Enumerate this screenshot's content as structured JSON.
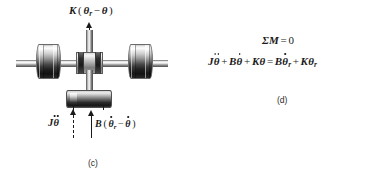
{
  "figure": {
    "panel_c": {
      "caption": "(c)",
      "spring_torque_label": {
        "symbol": "K",
        "expression": "K(θr − θ)",
        "parts": {
          "k": "K",
          "open": "(",
          "theta_r": "θ",
          "sub_r": "r",
          "minus": "−",
          "theta": "θ",
          "close": ")"
        }
      },
      "inertia_torque_label": {
        "expression": "Jθ̈",
        "parts": {
          "j": "J",
          "theta": "θ"
        }
      },
      "damper_torque_label": {
        "expression": "B(θ̇r − θ̇)",
        "parts": {
          "b": "B",
          "open": "(",
          "theta_r": "θ",
          "sub_r": "r",
          "minus": "−",
          "theta": "θ",
          "close": ")"
        }
      },
      "components": {
        "left_flywheel": "left-flywheel",
        "right_flywheel": "right-flywheel",
        "center_hub": "center-hub",
        "horizontal_shaft": "horizontal-shaft",
        "vertical_shaft": "vertical-shaft",
        "damper_disk": "damper-disk"
      }
    },
    "panel_d": {
      "caption": "(d)",
      "equation_1": {
        "expression": "ΣM = 0",
        "parts": {
          "sigma": "Σ",
          "m": "M",
          "equals": "=",
          "zero": "0"
        }
      },
      "equation_2": {
        "expression": "Jθ̈ + Bθ̇ + Kθ = Bθ̇r + Kθr",
        "parts": {
          "j": "J",
          "theta_ddot": "θ",
          "plus1": "+",
          "b": "B",
          "theta_dot": "θ",
          "plus2": "+",
          "k": "K",
          "theta": "θ",
          "equals": "=",
          "b2": "B",
          "theta_dot_r": "θ",
          "sub_r1": "r",
          "plus3": "+",
          "k2": "K",
          "theta_r": "θ",
          "sub_r2": "r"
        }
      }
    }
  },
  "colors": {
    "ink": "#1a1a1a",
    "caption": "#2b2b2b",
    "background": "#ffffff",
    "metal_light": "#f2f2f2",
    "metal_dark": "#171717"
  }
}
